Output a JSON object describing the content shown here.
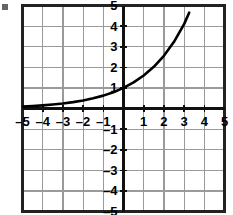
{
  "figure": {
    "kind": "cartesian-grid-plot",
    "background_color": "#ffffff",
    "grid_color": "#9a9a9a",
    "border_color": "#222222",
    "axis_color": "#111111",
    "curve_color": "#000000",
    "label_color": "#000000"
  },
  "chart_data": {
    "type": "line",
    "title": "",
    "subtitle": "",
    "xlabel": "",
    "ylabel": "",
    "xlim": [
      -5,
      5
    ],
    "ylim": [
      -5,
      5
    ],
    "grid": true,
    "legend": null,
    "x_ticks": [
      -5,
      -4,
      -3,
      -2,
      -1,
      1,
      2,
      3,
      4,
      5
    ],
    "y_ticks": [
      -5,
      -4,
      -3,
      -2,
      -1,
      1,
      2,
      3,
      4,
      5
    ],
    "x_tick_labels": [
      "–5",
      "–4",
      "–3",
      "–2",
      "–1",
      "1",
      "2",
      "3",
      "4",
      "5"
    ],
    "y_tick_labels": [
      "–5",
      "–4",
      "–3",
      "–2",
      "–1",
      "1",
      "2",
      "3",
      "4",
      "5"
    ],
    "annotations": [],
    "series": [
      {
        "name": "exponential-curve",
        "equation": "y = 1.6^x",
        "base": 1.6,
        "color": "#000000",
        "linewidth": 2.6,
        "x": [
          -5,
          -4.5,
          -4,
          -3.5,
          -3,
          -2.5,
          -2,
          -1.5,
          -1,
          -0.5,
          0,
          0.5,
          1,
          1.5,
          2,
          2.5,
          3,
          3.25
        ],
        "y": [
          0.095,
          0.12,
          0.153,
          0.193,
          0.244,
          0.309,
          0.391,
          0.494,
          0.625,
          0.791,
          1.0,
          1.265,
          1.6,
          2.024,
          2.56,
          3.238,
          4.096,
          4.65
        ]
      }
    ]
  },
  "labels": {
    "x_axis": [
      {
        "value": -5,
        "text": "–5"
      },
      {
        "value": -4,
        "text": "–4"
      },
      {
        "value": -3,
        "text": "–3"
      },
      {
        "value": -2,
        "text": "–2"
      },
      {
        "value": -1,
        "text": "–1"
      },
      {
        "value": 1,
        "text": "1"
      },
      {
        "value": 2,
        "text": "2"
      },
      {
        "value": 3,
        "text": "3"
      },
      {
        "value": 4,
        "text": "4"
      },
      {
        "value": 5,
        "text": "5"
      }
    ],
    "y_axis": [
      {
        "value": 5,
        "text": "5"
      },
      {
        "value": 4,
        "text": "4"
      },
      {
        "value": 3,
        "text": "3"
      },
      {
        "value": 2,
        "text": "2"
      },
      {
        "value": 1,
        "text": "1"
      },
      {
        "value": -1,
        "text": "–1"
      },
      {
        "value": -2,
        "text": "–2"
      },
      {
        "value": -3,
        "text": "–3"
      },
      {
        "value": -4,
        "text": "–4"
      },
      {
        "value": -5,
        "text": "–5"
      }
    ]
  }
}
